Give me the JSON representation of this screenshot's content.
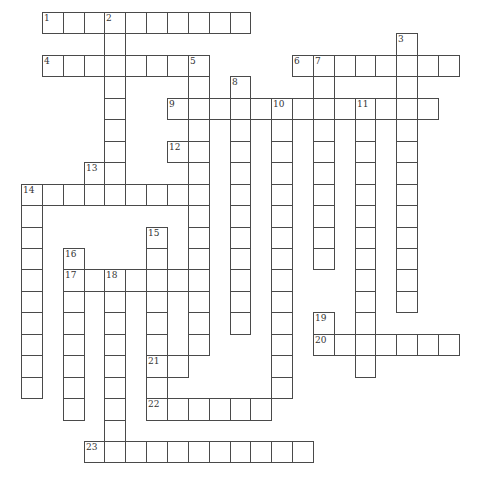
{
  "puzzle": {
    "type": "crossword",
    "grid": {
      "x0": 21,
      "y0": 12,
      "cell_w": 20.85,
      "cell_h": 21.45
    },
    "colors": {
      "line": "#4a4a4a",
      "cell_bg": "#ffffff",
      "number": "#333333"
    },
    "across": [
      {
        "number": "1",
        "row": 0,
        "col": 1,
        "length": 10
      },
      {
        "number": "4",
        "row": 2,
        "col": 1,
        "length": 8
      },
      {
        "number": "6",
        "row": 2,
        "col": 13,
        "length": 8
      },
      {
        "number": "9",
        "row": 4,
        "col": 7,
        "length": 13
      },
      {
        "number": "12",
        "row": 6,
        "col": 7,
        "length": 2
      },
      {
        "number": "14",
        "row": 8,
        "col": 0,
        "length": 9
      },
      {
        "number": "17",
        "row": 12,
        "col": 2,
        "length": 7
      },
      {
        "number": "20",
        "row": 15,
        "col": 14,
        "length": 7
      },
      {
        "number": "21",
        "row": 16,
        "col": 6,
        "length": 2
      },
      {
        "number": "22",
        "row": 18,
        "col": 6,
        "length": 6
      },
      {
        "number": "23",
        "row": 20,
        "col": 3,
        "length": 11
      }
    ],
    "down": [
      {
        "number": "2",
        "row": 0,
        "col": 4,
        "length": 9
      },
      {
        "number": "3",
        "row": 1,
        "col": 18,
        "length": 13
      },
      {
        "number": "5",
        "row": 2,
        "col": 8,
        "length": 14
      },
      {
        "number": "7",
        "row": 2,
        "col": 14,
        "length": 10
      },
      {
        "number": "8",
        "row": 3,
        "col": 10,
        "length": 12
      },
      {
        "number": "10",
        "row": 4,
        "col": 12,
        "length": 14
      },
      {
        "number": "11",
        "row": 4,
        "col": 16,
        "length": 13
      },
      {
        "number": "13",
        "row": 7,
        "col": 3,
        "length": 2
      },
      {
        "number": "14",
        "row": 8,
        "col": 0,
        "length": 10
      },
      {
        "number": "15",
        "row": 10,
        "col": 6,
        "length": 9
      },
      {
        "number": "16",
        "row": 11,
        "col": 2,
        "length": 8
      },
      {
        "number": "18",
        "row": 12,
        "col": 4,
        "length": 9
      },
      {
        "number": "19",
        "row": 14,
        "col": 14,
        "length": 2
      }
    ]
  }
}
